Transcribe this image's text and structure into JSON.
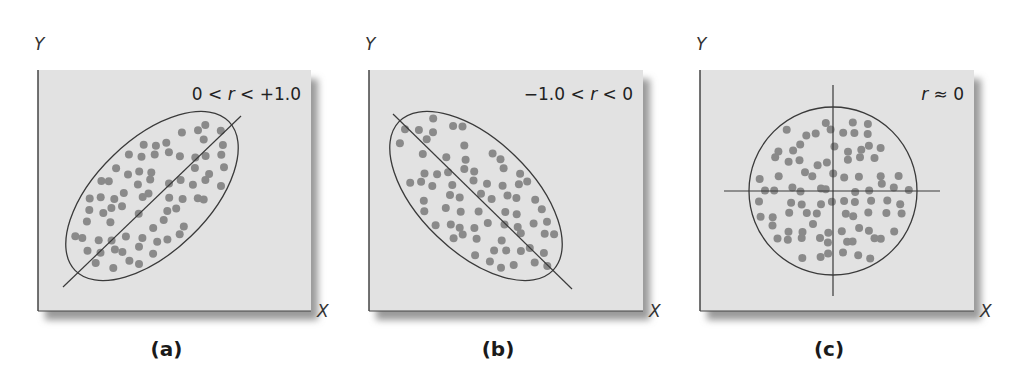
{
  "figure": {
    "colors": {
      "background": "#ffffff",
      "panel_fill": "#e2e2e2",
      "panel_border": "#555555",
      "shadow": "#9a9a9a",
      "dot": "#8a8a8a",
      "line": "#3a3a3a"
    },
    "panels": [
      {
        "id": "a",
        "caption": "(a)",
        "y_axis_label": "Y",
        "x_axis_label": "X",
        "correlation_label": {
          "pre": "0 < ",
          "r": "r",
          "post": " < +1.0"
        },
        "description": "positive correlation",
        "box": {
          "x": 38,
          "y": 70,
          "w": 273,
          "h": 241
        },
        "shape": {
          "type": "ellipse",
          "cx": 152,
          "cy": 196,
          "rx": 107,
          "ry": 56,
          "rotate": -44
        },
        "lines": [
          {
            "x1": 63,
            "y1": 287,
            "x2": 241,
            "y2": 116
          }
        ]
      },
      {
        "id": "b",
        "caption": "(b)",
        "y_axis_label": "Y",
        "x_axis_label": "X",
        "correlation_label": {
          "pre": "−1.0 < ",
          "r": "r",
          "post": " < 0"
        },
        "description": "negative correlation",
        "box": {
          "x": 369,
          "y": 70,
          "w": 274,
          "h": 241
        },
        "shape": {
          "type": "ellipse",
          "cx": 476,
          "cy": 196,
          "rx": 107,
          "ry": 56,
          "rotate": 44
        },
        "lines": [
          {
            "x1": 393,
            "y1": 114,
            "x2": 572,
            "y2": 289
          }
        ]
      },
      {
        "id": "c",
        "caption": "(c)",
        "y_axis_label": "Y",
        "x_axis_label": "X",
        "correlation_label": {
          "pre": "",
          "r": "r",
          "post": " ≈ 0"
        },
        "description": "no correlation",
        "box": {
          "x": 700,
          "y": 70,
          "w": 274,
          "h": 241
        },
        "shape": {
          "type": "circle",
          "cx": 833,
          "cy": 191,
          "r": 84
        },
        "lines": [
          {
            "x1": 833,
            "y1": 85,
            "x2": 833,
            "y2": 296
          },
          {
            "x1": 724,
            "y1": 191,
            "x2": 940,
            "y2": 191
          }
        ]
      }
    ]
  },
  "chart_data": [
    {
      "type": "scatter",
      "title": "0 < r < +1.0",
      "caption": "(a)",
      "xlabel": "X",
      "ylabel": "Y",
      "relationship": "positive linear correlation",
      "r_range": [
        0,
        1.0
      ],
      "point_count_approx": 90,
      "trend_line": "increasing diagonal",
      "enclosure": "ellipse tilted upward (~45°)",
      "grid": false
    },
    {
      "type": "scatter",
      "title": "−1.0 < r < 0",
      "caption": "(b)",
      "xlabel": "X",
      "ylabel": "Y",
      "relationship": "negative linear correlation",
      "r_range": [
        -1.0,
        0
      ],
      "point_count_approx": 90,
      "trend_line": "decreasing diagonal",
      "enclosure": "ellipse tilted downward (~-45°)",
      "grid": false
    },
    {
      "type": "scatter",
      "title": "r ≈ 0",
      "caption": "(c)",
      "xlabel": "X",
      "ylabel": "Y",
      "relationship": "no correlation",
      "r_value": 0,
      "point_count_approx": 110,
      "trend_line": "none (horizontal and vertical reference lines through center)",
      "enclosure": "circle",
      "grid": false
    }
  ]
}
